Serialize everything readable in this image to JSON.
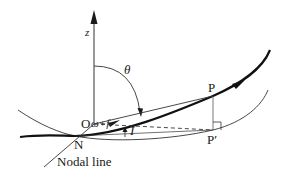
{
  "diagram": {
    "type": "orbital-geometry",
    "labels": {
      "z_axis": "z",
      "theta": "θ",
      "origin": "O",
      "point_p": "P",
      "point_p_prime": "P′",
      "node": "N",
      "argument": "ω+f",
      "inclination": "I",
      "nodal_line": "Nodal line"
    },
    "colors": {
      "stroke": "#1a1a1a",
      "thin_stroke": "#333333",
      "background": "#ffffff"
    }
  }
}
